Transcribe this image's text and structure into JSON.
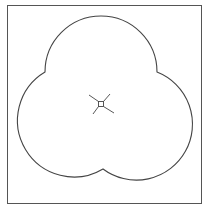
{
  "diagram": {
    "type": "trefoil-outline",
    "frame": {
      "x": 7,
      "y": 5,
      "width": 194,
      "height": 198,
      "stroke": "#555555"
    },
    "shape": {
      "stroke": "#444444",
      "fill": "#ffffff",
      "lobes": [
        {
          "name": "top",
          "cx": 101,
          "cy": 63,
          "r": 56
        },
        {
          "name": "left",
          "cx": 67,
          "cy": 126,
          "r": 56
        },
        {
          "name": "right",
          "cx": 139,
          "cy": 126,
          "r": 56
        }
      ],
      "cusps": [
        {
          "name": "left",
          "x": 45,
          "y": 72
        },
        {
          "name": "right",
          "x": 157,
          "y": 72
        },
        {
          "name": "bottom",
          "x": 103,
          "y": 169
        }
      ]
    },
    "center_marker": {
      "x": 101,
      "y": 104,
      "square_size": 5,
      "spoke_length": 10,
      "stroke": "#444444",
      "icon": "center-cross-marker"
    }
  }
}
